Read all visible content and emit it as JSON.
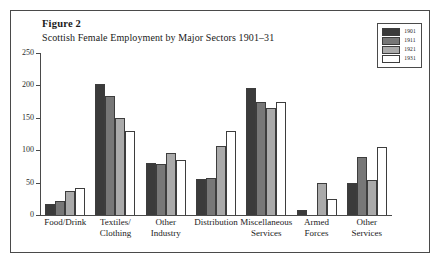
{
  "figure": {
    "label": "Figure 2",
    "subtitle": "Scottish Female Employment by Major Sectors 1901–31"
  },
  "chart_data": {
    "type": "bar",
    "title": "Scottish Female Employment by Major Sectors 1901–31",
    "subtitle": "Figure 2",
    "xlabel": "",
    "ylabel": "",
    "ylim": [
      0,
      250
    ],
    "yticks": [
      0,
      50,
      100,
      150,
      200,
      250
    ],
    "ytick_labels": [
      "0",
      "50",
      "100",
      "150",
      "200",
      "250"
    ],
    "grid": false,
    "legend_position": "top-right",
    "categories": [
      "Food/Drink",
      "Textiles/\nClothing",
      "Other\nIndustry",
      "Distribution",
      "Miscellaneous\nServices",
      "Armed\nForces",
      "Other\nServices"
    ],
    "category_lines": [
      [
        "Food/Drink"
      ],
      [
        "Textiles/",
        "Clothing"
      ],
      [
        "Other",
        "Industry"
      ],
      [
        "Distribution"
      ],
      [
        "Miscellaneous",
        "Services"
      ],
      [
        "Armed",
        "Forces"
      ],
      [
        "Other",
        "Services"
      ]
    ],
    "series": [
      {
        "name": "1901",
        "color": "#3b3b3b",
        "values": [
          17,
          202,
          80,
          56,
          196,
          7,
          50
        ]
      },
      {
        "name": "1911",
        "color": "#777777",
        "values": [
          22,
          184,
          78,
          57,
          174,
          0,
          89
        ]
      },
      {
        "name": "1921",
        "color": "#aaaaaa",
        "values": [
          37,
          149,
          95,
          107,
          165,
          49,
          54
        ]
      },
      {
        "name": "1931",
        "color": "#ffffff",
        "values": [
          41,
          130,
          85,
          130,
          175,
          24,
          105
        ]
      }
    ]
  },
  "legend": {
    "entries": [
      {
        "label": "1901",
        "color": "#3b3b3b"
      },
      {
        "label": "1911",
        "color": "#777777"
      },
      {
        "label": "1921",
        "color": "#aaaaaa"
      },
      {
        "label": "1931",
        "color": "#ffffff"
      }
    ]
  }
}
